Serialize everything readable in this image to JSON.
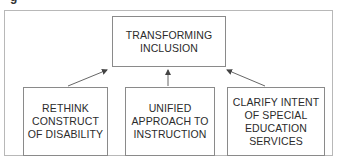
{
  "caption_fragment": "g",
  "diagram": {
    "top": {
      "label": "TRANSFORMING\nINCLUSION"
    },
    "bottom": [
      {
        "label": "RETHINK\nCONSTRUCT\nOF DISABILITY"
      },
      {
        "label": "UNIFIED\nAPPROACH TO\nINSTRUCTION"
      },
      {
        "label": "CLARIFY INTENT\nOF SPECIAL\nEDUCATION\nSERVICES"
      }
    ],
    "edges": [
      {
        "from": "bottom.0",
        "to": "top"
      },
      {
        "from": "bottom.1",
        "to": "top"
      },
      {
        "from": "bottom.2",
        "to": "top"
      }
    ],
    "colors": {
      "box_border": "#8a8a8a",
      "frame_border": "#b8b8b8",
      "arrow": "#444444",
      "text": "#2b2b2b"
    }
  }
}
